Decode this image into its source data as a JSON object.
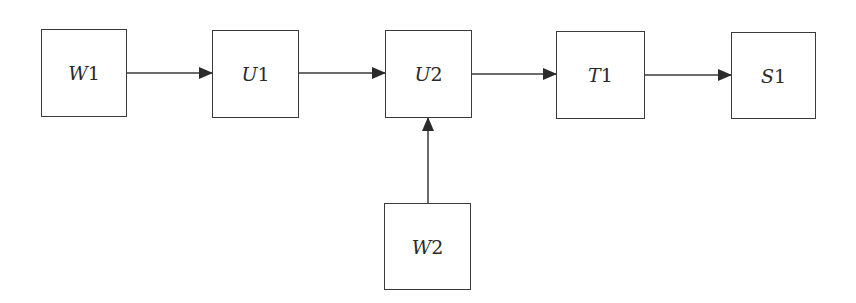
{
  "diagram": {
    "type": "flow-block-diagram",
    "colors": {
      "stroke": "#3a3a3a",
      "text": "#2a2a2a",
      "background": "#ffffff"
    },
    "nodes": [
      {
        "id": "W1",
        "var": "W",
        "index": "1",
        "x": 41,
        "y": 29,
        "w": 86,
        "h": 88
      },
      {
        "id": "U1",
        "var": "U",
        "index": "1",
        "x": 212,
        "y": 30,
        "w": 87,
        "h": 88
      },
      {
        "id": "U2",
        "var": "U",
        "index": "2",
        "x": 385,
        "y": 30,
        "w": 87,
        "h": 88
      },
      {
        "id": "T1",
        "var": "T",
        "index": "1",
        "x": 556,
        "y": 31,
        "w": 89,
        "h": 88
      },
      {
        "id": "S1",
        "var": "S",
        "index": "1",
        "x": 731,
        "y": 32,
        "w": 85,
        "h": 87
      },
      {
        "id": "W2",
        "var": "W",
        "index": "2",
        "x": 384,
        "y": 203,
        "w": 87,
        "h": 87
      }
    ],
    "edges": [
      {
        "from": "W1",
        "to": "U1",
        "x1": 127,
        "y1": 73,
        "x2": 212,
        "y2": 73
      },
      {
        "from": "U1",
        "to": "U2",
        "x1": 299,
        "y1": 73,
        "x2": 385,
        "y2": 73
      },
      {
        "from": "U2",
        "to": "T1",
        "x1": 472,
        "y1": 74,
        "x2": 556,
        "y2": 74
      },
      {
        "from": "T1",
        "to": "S1",
        "x1": 645,
        "y1": 75,
        "x2": 731,
        "y2": 75
      },
      {
        "from": "W2",
        "to": "U2",
        "x1": 428,
        "y1": 203,
        "x2": 428,
        "y2": 118
      }
    ]
  }
}
